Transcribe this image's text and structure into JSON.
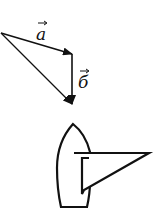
{
  "diagram": {
    "type": "vector-addition-with-sailboat",
    "vectors": [
      {
        "id": "a",
        "label": "a",
        "from": [
          1,
          33
        ],
        "to": [
          72,
          54
        ]
      },
      {
        "id": "b",
        "label": "б",
        "from": [
          72,
          54
        ],
        "to": [
          72,
          104
        ]
      },
      {
        "id": "resultant",
        "label": "",
        "from": [
          1,
          33
        ],
        "to": [
          72,
          104
        ]
      }
    ],
    "labels": {
      "a": "a",
      "b": "б"
    },
    "boat": {
      "description": "sailboat hull viewed from above with a triangular sail"
    },
    "colors": {
      "stroke": "#111111",
      "background": "#ffffff"
    }
  }
}
